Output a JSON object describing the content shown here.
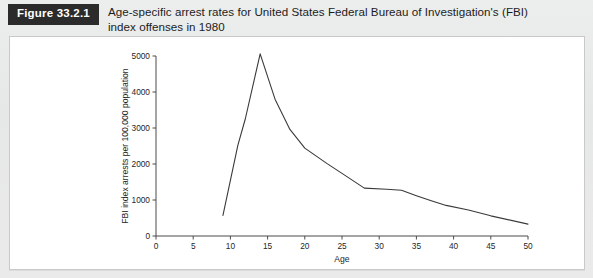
{
  "figure": {
    "badge_label": "Figure 33.2.1",
    "caption": "Age-specific arrest rates for United States Federal Bureau of Investigation's (FBI) index offenses in 1980"
  },
  "chart_data": {
    "type": "line",
    "title": "",
    "xlabel": "Age",
    "ylabel": "FBI index arrests per 100,000 population",
    "xlim": [
      0,
      50
    ],
    "ylim": [
      0,
      5000
    ],
    "xticks": [
      0,
      5,
      10,
      15,
      20,
      25,
      30,
      35,
      40,
      45,
      50
    ],
    "xtick_labels": [
      "0",
      "5",
      "10",
      "15",
      "20",
      "25",
      "30",
      "35",
      "40",
      "45",
      "50"
    ],
    "yticks": [
      0,
      1000,
      2000,
      3000,
      4000,
      5000
    ],
    "ytick_labels": [
      "0",
      "1000",
      "2000",
      "3000",
      "4000",
      "5000"
    ],
    "grid": false,
    "legend": "none",
    "line_color": "#3a3a3a",
    "series": [
      {
        "name": "FBI index arrest rate",
        "x": [
          9,
          11,
          12,
          14,
          16,
          18,
          20,
          23,
          25,
          28,
          31,
          33,
          35,
          37,
          39,
          42,
          45,
          50
        ],
        "values": [
          570,
          2520,
          3250,
          5060,
          3800,
          2960,
          2440,
          2010,
          1740,
          1330,
          1300,
          1270,
          1120,
          980,
          850,
          720,
          560,
          330
        ]
      }
    ]
  },
  "colors": {
    "badge_background": "#2b2b2b",
    "badge_text": "#ffffff",
    "page_background": "#e8e8e8",
    "panel_background": "#ffffff",
    "axis": "#4a4a4a"
  }
}
